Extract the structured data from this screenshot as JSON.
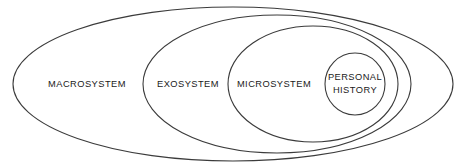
{
  "diagram": {
    "background_color": "#ffffff",
    "stroke_color": "#3b3b3b",
    "text_color": "#1a1a1a",
    "rings": [
      {
        "id": "macrosystem",
        "label": "MACROSYSTEM",
        "fill": "#cfcfcf",
        "cx": 233,
        "cy": 84,
        "rx": 220,
        "ry": 77,
        "label_x": 87,
        "label_y": 85
      },
      {
        "id": "exosystem",
        "label": "EXOSYSTEM",
        "fill": "#e2e2e2",
        "cx": 277,
        "cy": 84,
        "rx": 134,
        "ry": 69,
        "label_x": 188,
        "label_y": 85
      },
      {
        "id": "microsystem",
        "label": "MICROSYSTEM",
        "fill": "#efefef",
        "cx": 313,
        "cy": 84,
        "rx": 85,
        "ry": 58,
        "label_x": 274,
        "label_y": 85
      },
      {
        "id": "personal-history",
        "label": "PERSONAL HISTORY",
        "label_line_1": "PERSONAL",
        "label_line_2": "HISTORY",
        "fill": "#ffffff",
        "cx": 355,
        "cy": 84,
        "rx": 30,
        "ry": 31,
        "label_x": 355,
        "label_y": 78
      }
    ]
  }
}
